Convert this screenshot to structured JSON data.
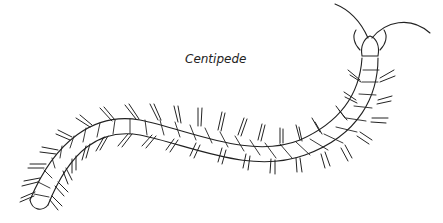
{
  "illustration": {
    "title": "Centipede",
    "subject": "centipede line drawing",
    "stroke_color": "#222222",
    "background_color": "#ffffff"
  }
}
